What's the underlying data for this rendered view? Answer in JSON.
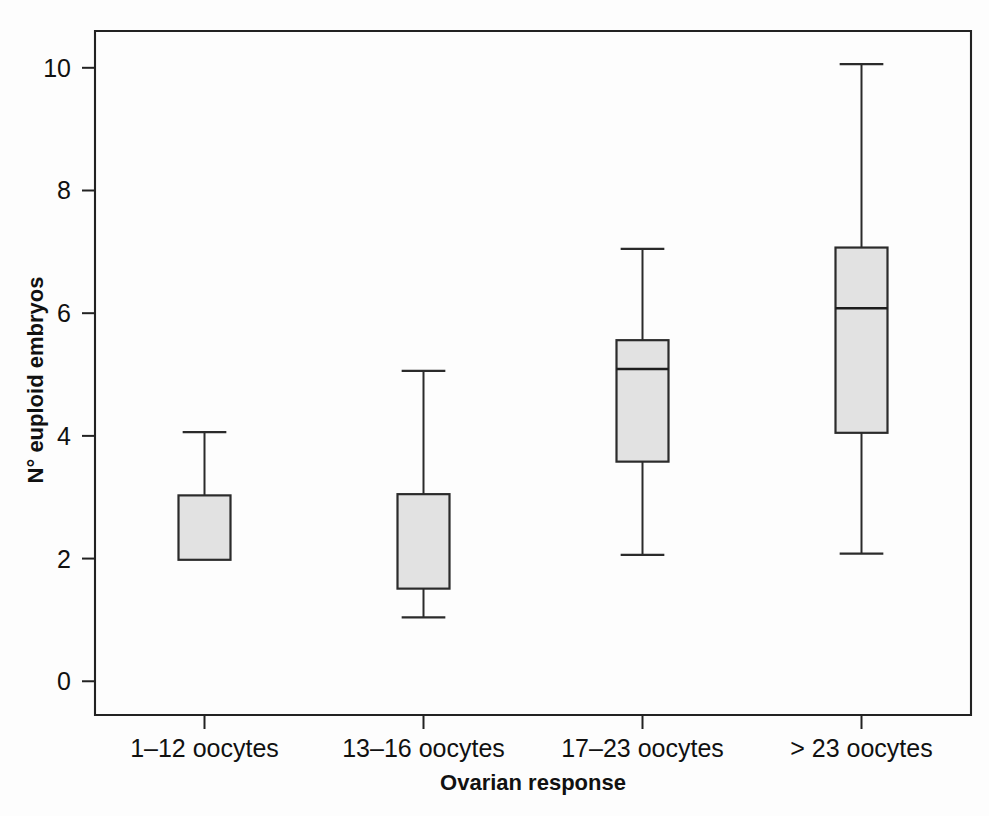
{
  "chart_data": {
    "type": "box",
    "title": "",
    "xlabel": "Ovarian response",
    "ylabel": "N° euploid embryos",
    "categories": [
      "1–12 oocytes",
      "13–16 oocytes",
      "17–23 oocytes",
      "> 23 oocytes"
    ],
    "ylim": [
      -0.55,
      10.6
    ],
    "yticks": [
      0,
      2,
      4,
      6,
      8,
      10
    ],
    "ytick_labels": [
      "0",
      "2",
      "4",
      "6",
      "8",
      "10"
    ],
    "grid": false,
    "legend": null,
    "box_fill_color": "#e2e2e2",
    "line_color": "#2b2b2b",
    "boxes": [
      {
        "category": "1–12 oocytes",
        "whisker_low": 1.98,
        "q1": 1.98,
        "median": 1.98,
        "q3": 3.03,
        "whisker_high": 4.06,
        "median_visible": false,
        "lower_whisker_visible": false
      },
      {
        "category": "13–16 oocytes",
        "whisker_low": 1.04,
        "q1": 1.51,
        "median": 1.51,
        "q3": 3.05,
        "whisker_high": 5.06,
        "median_visible": false,
        "lower_whisker_visible": true
      },
      {
        "category": "17–23 oocytes",
        "whisker_low": 2.06,
        "q1": 3.58,
        "median": 5.09,
        "q3": 5.56,
        "whisker_high": 7.05,
        "median_visible": true,
        "lower_whisker_visible": true
      },
      {
        "category": "> 23 oocytes",
        "whisker_low": 2.08,
        "q1": 4.05,
        "median": 6.08,
        "q3": 7.07,
        "whisker_high": 10.06,
        "median_visible": true,
        "lower_whisker_visible": true
      }
    ]
  }
}
